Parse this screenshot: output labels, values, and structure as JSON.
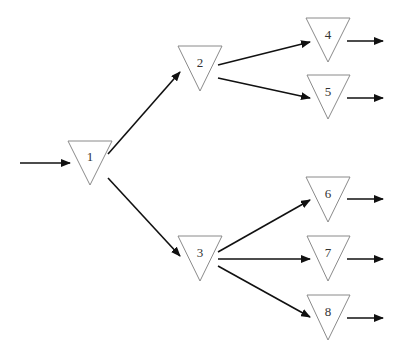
{
  "diagram": {
    "type": "tree",
    "nodes": [
      {
        "id": "1",
        "label": "1"
      },
      {
        "id": "2",
        "label": "2"
      },
      {
        "id": "3",
        "label": "3"
      },
      {
        "id": "4",
        "label": "4"
      },
      {
        "id": "5",
        "label": "5"
      },
      {
        "id": "6",
        "label": "6"
      },
      {
        "id": "7",
        "label": "7"
      },
      {
        "id": "8",
        "label": "8"
      }
    ],
    "edges": [
      {
        "from": "input",
        "to": "1"
      },
      {
        "from": "1",
        "to": "2"
      },
      {
        "from": "1",
        "to": "3"
      },
      {
        "from": "2",
        "to": "4"
      },
      {
        "from": "2",
        "to": "5"
      },
      {
        "from": "3",
        "to": "6"
      },
      {
        "from": "3",
        "to": "7"
      },
      {
        "from": "3",
        "to": "8"
      },
      {
        "from": "4",
        "to": "output"
      },
      {
        "from": "5",
        "to": "output"
      },
      {
        "from": "6",
        "to": "output"
      },
      {
        "from": "7",
        "to": "output"
      },
      {
        "from": "8",
        "to": "output"
      }
    ],
    "colors": {
      "edge": "#111111",
      "node_stroke": "#8a8a8a",
      "background": "#ffffff"
    }
  }
}
